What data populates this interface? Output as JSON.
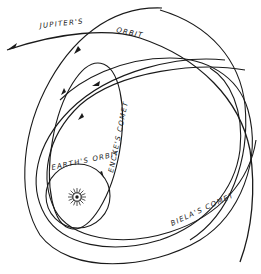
{
  "diagram": {
    "type": "orbital-diagram",
    "labels": {
      "jupiter_orbit_1": "JUPITER'S",
      "jupiter_orbit_2": "ORBIT",
      "earth_orbit": "EARTH'S ORBIT",
      "encke_comet": "ENCKE'S COMET",
      "biela_comet": "BIELA'S COMET"
    },
    "elements": [
      {
        "id": "sun",
        "kind": "star",
        "center": [
          77,
          197
        ]
      },
      {
        "id": "earth-orbit",
        "kind": "circle",
        "label": "EARTH'S ORBIT"
      },
      {
        "id": "encke-comet-orbit",
        "kind": "ellipse",
        "label": "ENCKE'S COMET"
      },
      {
        "id": "biela-comet-orbit",
        "kind": "ellipse",
        "label": "BIELA'S COMET"
      },
      {
        "id": "jupiter-orbit",
        "kind": "arc",
        "label": "JUPITER'S ORBIT"
      }
    ],
    "colors": {
      "line": "#1a1a1a",
      "background": "#ffffff"
    }
  }
}
